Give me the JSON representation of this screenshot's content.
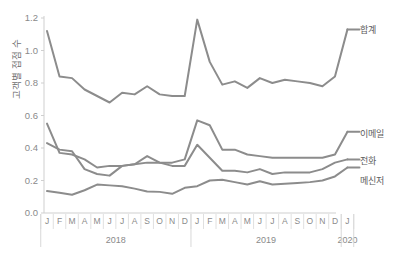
{
  "chart_data": {
    "type": "line",
    "title": "",
    "subtitle": "",
    "xlabel": "",
    "ylabel": "고객별 접점 수",
    "ylim": [
      0.0,
      1.2
    ],
    "yticks": [
      "0.0",
      "0.2",
      "0.4",
      "0.6",
      "0.8",
      "1.0",
      "1.2"
    ],
    "ytick_values": [
      0.0,
      0.2,
      0.4,
      0.6,
      0.8,
      1.0,
      1.2
    ],
    "grid": false,
    "legend_position": "right-inline",
    "x": [
      "J",
      "F",
      "M",
      "A",
      "M",
      "J",
      "J",
      "A",
      "S",
      "O",
      "N",
      "D",
      "J",
      "F",
      "M",
      "A",
      "M",
      "J",
      "J",
      "A",
      "S",
      "O",
      "N",
      "D",
      "J"
    ],
    "xtick_labels": [
      "J",
      "F",
      "M",
      "A",
      "M",
      "J",
      "J",
      "A",
      "S",
      "O",
      "N",
      "D",
      "J",
      "F",
      "M",
      "A",
      "M",
      "J",
      "J",
      "A",
      "S",
      "O",
      "N",
      "D",
      "J"
    ],
    "year_groups": [
      {
        "label": "2018",
        "start_index": 0,
        "end_index": 11
      },
      {
        "label": "2019",
        "start_index": 12,
        "end_index": 23
      },
      {
        "label": "2020",
        "start_index": 24,
        "end_index": 24
      }
    ],
    "series": [
      {
        "name": "합계",
        "color": "#8c8c8c",
        "values": [
          1.12,
          0.84,
          0.83,
          0.76,
          0.72,
          0.68,
          0.74,
          0.73,
          0.78,
          0.73,
          0.72,
          0.72,
          1.19,
          0.93,
          0.79,
          0.81,
          0.77,
          0.83,
          0.8,
          0.82,
          0.81,
          0.8,
          0.78,
          0.84,
          1.13
        ]
      },
      {
        "name": "이메일",
        "color": "#8c8c8c",
        "values": [
          0.55,
          0.37,
          0.36,
          0.33,
          0.28,
          0.29,
          0.29,
          0.3,
          0.31,
          0.31,
          0.31,
          0.33,
          0.57,
          0.54,
          0.39,
          0.39,
          0.36,
          0.35,
          0.34,
          0.34,
          0.34,
          0.34,
          0.34,
          0.36,
          0.5
        ]
      },
      {
        "name": "전화",
        "color": "#8c8c8c",
        "values": [
          0.43,
          0.39,
          0.38,
          0.27,
          0.24,
          0.23,
          0.29,
          0.3,
          0.35,
          0.31,
          0.29,
          0.29,
          0.42,
          0.34,
          0.26,
          0.26,
          0.25,
          0.27,
          0.24,
          0.25,
          0.25,
          0.25,
          0.27,
          0.31,
          0.33
        ]
      },
      {
        "name": "메신저",
        "color": "#8c8c8c",
        "values": [
          0.135,
          0.125,
          0.112,
          0.14,
          0.175,
          0.17,
          0.165,
          0.15,
          0.132,
          0.13,
          0.118,
          0.155,
          0.165,
          0.2,
          0.205,
          0.19,
          0.175,
          0.195,
          0.175,
          0.18,
          0.185,
          0.19,
          0.2,
          0.225,
          0.28
        ]
      }
    ]
  },
  "legend": {
    "items": [
      {
        "label": "합계"
      },
      {
        "label": "이메일"
      },
      {
        "label": "전화"
      },
      {
        "label": "메신저"
      }
    ]
  },
  "axis": {
    "y_title": "고객별 접점 수"
  }
}
